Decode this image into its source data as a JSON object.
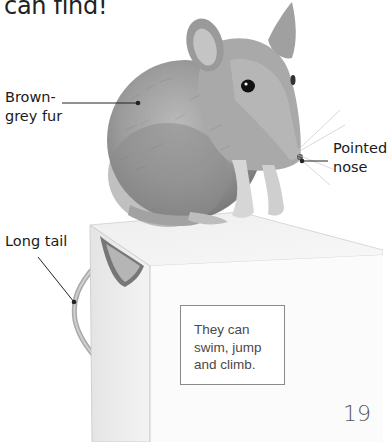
{
  "page": {
    "heading_fragment": "can find!",
    "page_number": "19"
  },
  "illustration": {
    "subject": "house mouse sitting on a paper box",
    "labels": [
      {
        "id": "fur",
        "text": "Brown-\ngrey fur"
      },
      {
        "id": "nose",
        "text": "Pointed\nnose"
      },
      {
        "id": "tail",
        "text": "Long tail"
      }
    ]
  },
  "fact_box": {
    "text": "They can\nswim, jump\nand climb."
  },
  "colors": {
    "text": "#1a1a1a",
    "box_border": "#8a8a8a",
    "box_text": "#4a4a4a",
    "leader_line": "#222222"
  }
}
